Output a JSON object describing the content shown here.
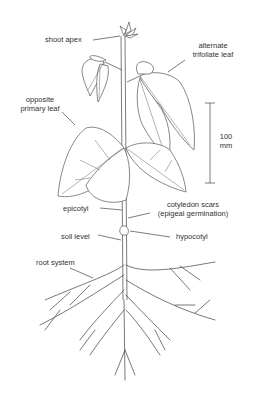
{
  "diagram": {
    "labels": {
      "shoot_apex": "shoot apex",
      "alternate_trifoliate_leaf_1": "alternate",
      "alternate_trifoliate_leaf_2": "trifoliate leaf",
      "opposite_primary_leaf_1": "opposite",
      "opposite_primary_leaf_2": "primary leaf",
      "epicotyl": "epicotyl",
      "cotyledon_scars_1": "cotyledon scars",
      "cotyledon_scars_2": "(epigeal germination)",
      "soil_level": "soil level",
      "hypocotyl": "hypocotyl",
      "root_system": "root system"
    },
    "scale_bar": {
      "value": "100",
      "unit": "mm"
    },
    "colors": {
      "line": "#444444",
      "text": "#333333",
      "background": "#ffffff"
    }
  }
}
